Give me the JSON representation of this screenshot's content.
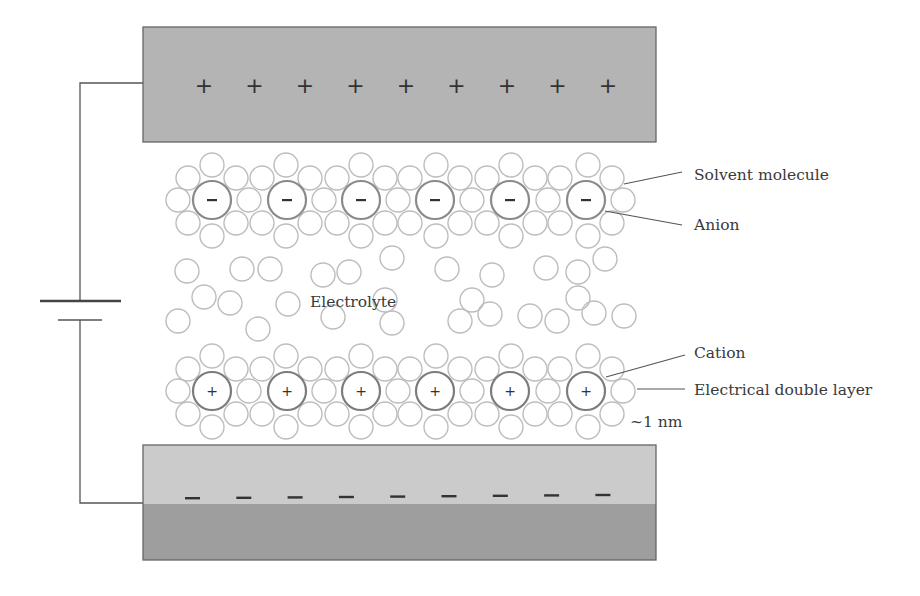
{
  "diagram": {
    "labels": {
      "solvent_molecule": "Solvent molecule",
      "anion": "Anion",
      "electrolyte": "Electrolyte",
      "cation": "Cation",
      "double_layer": "Electrical double layer",
      "thickness": "~1 nm"
    },
    "positive_electrode": {
      "symbol": "+",
      "count": 9,
      "fill": "#b4b4b4"
    },
    "negative_electrode": {
      "symbol": "−",
      "count": 9,
      "fill_top": "#cbcbcb",
      "fill_bottom": "#9e9e9e"
    },
    "anion_symbol": "−",
    "cation_symbol": "+",
    "ion_count_per_layer": 6,
    "colors": {
      "solvent_stroke": "#bdbdbd",
      "ion_stroke": "#8a8a8a",
      "line": "#555555",
      "electrode_border": "#666666"
    }
  }
}
